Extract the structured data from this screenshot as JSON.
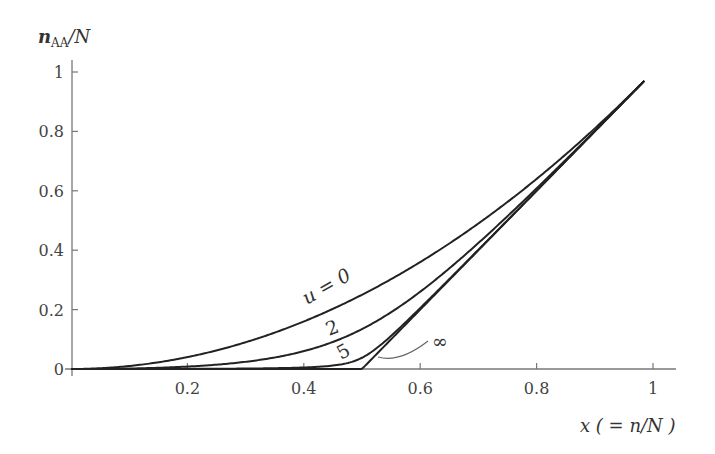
{
  "chart_data": {
    "type": "line",
    "title": "",
    "xlabel": "x ( = n/N )",
    "ylabel": "n_AA / N",
    "xlim": [
      0,
      1.04
    ],
    "ylim": [
      0,
      1.02
    ],
    "x_ticks": [
      "0.2",
      "0.4",
      "0.6",
      "0.8",
      "1"
    ],
    "y_ticks": [
      "0",
      "0.2",
      "0.4",
      "0.6",
      "0.8",
      "1"
    ],
    "grid": false,
    "legend": "inline curve labels",
    "x": [
      0,
      0.1,
      0.2,
      0.3,
      0.4,
      0.5,
      0.6,
      0.7,
      0.8,
      0.9,
      0.985
    ],
    "series": [
      {
        "name": "u=0",
        "label": "u = 0",
        "values": [
          0,
          0.01,
          0.04,
          0.09,
          0.16,
          0.25,
          0.36,
          0.49,
          0.64,
          0.81,
          0.97
        ]
      },
      {
        "name": "u=2",
        "label": "2",
        "values": [
          0,
          0.0016,
          0.0082,
          0.0242,
          0.0601,
          0.1345,
          0.2601,
          0.4242,
          0.6082,
          0.8016,
          0.97
        ]
      },
      {
        "name": "u=5",
        "label": "5",
        "values": [
          0,
          0.0001,
          0.0005,
          0.0015,
          0.0051,
          0.0379,
          0.2051,
          0.4015,
          0.6005,
          0.8001,
          0.97
        ]
      },
      {
        "name": "u=∞",
        "label": "∞",
        "values": [
          0,
          0,
          0,
          0,
          0,
          0,
          0.2,
          0.4,
          0.6,
          0.8,
          0.97
        ]
      }
    ]
  },
  "axes": {
    "y_title_main": "n",
    "y_title_sub": "AA",
    "y_title_rest": "/N",
    "x_title": "x ( = n/N )",
    "x_ticks": [
      "0.2",
      "0.4",
      "0.6",
      "0.8",
      "1"
    ],
    "y_ticks": [
      "0",
      "0.2",
      "0.4",
      "0.6",
      "0.8",
      "1"
    ]
  },
  "labels": {
    "u0": "u = 0",
    "u2": "2",
    "u5": "5",
    "uinf": "∞"
  }
}
